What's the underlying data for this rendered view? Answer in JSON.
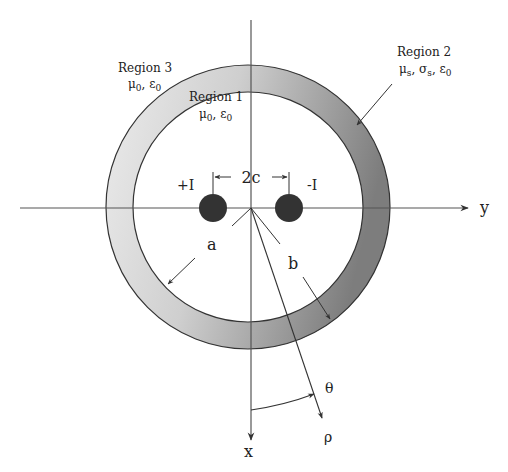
{
  "diagram": {
    "type": "cross-section",
    "title": "",
    "regions": {
      "region1": {
        "label": "Region 1",
        "props": "μ",
        "sub1": "0",
        "sep": ", ε",
        "sub2": "0"
      },
      "region2": {
        "label": "Region 2",
        "props_mu": "μ",
        "mu_sub": "s",
        "props_sigma": ", σ",
        "sigma_sub": "s",
        "props_eps": ", ε",
        "eps_sub": "0"
      },
      "region3": {
        "label": "Region 3",
        "props": "μ",
        "sub1": "0",
        "sep": ", ε",
        "sub2": "0"
      }
    },
    "wires": {
      "left_label": "+I",
      "right_label": "-I",
      "separation_label": "2c"
    },
    "radii": {
      "inner_label": "a",
      "outer_label": "b"
    },
    "axes": {
      "horizontal_label": "y",
      "vertical_label": "x",
      "radial_label": "ρ",
      "angle_label": "θ"
    },
    "colors": {
      "ring_light": "#e4e4e4",
      "ring_dark": "#8a8a8a",
      "wire_fill": "#333333",
      "line": "#333333"
    }
  }
}
